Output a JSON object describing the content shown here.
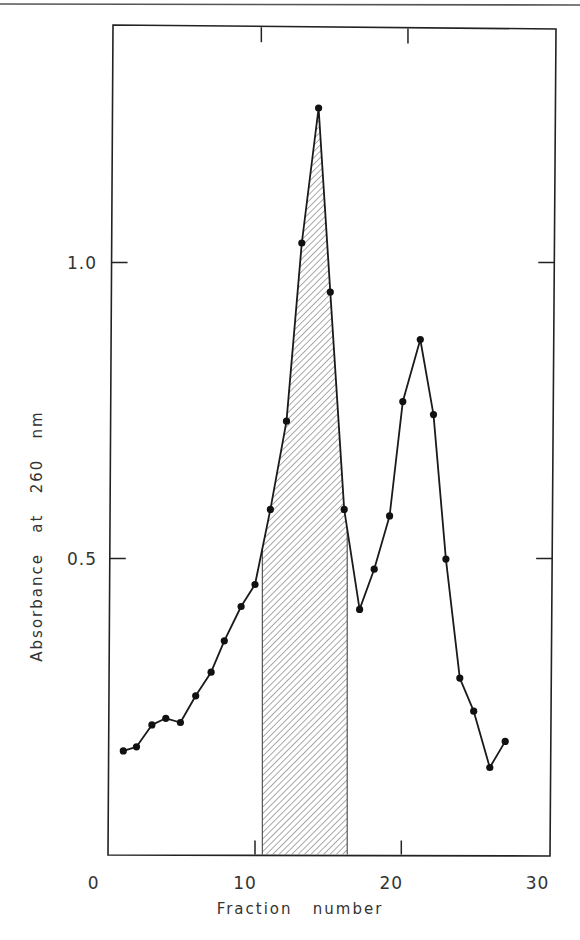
{
  "chart_data": {
    "type": "line",
    "title": "",
    "xlabel": "Fraction   number",
    "ylabel": "Absorbance   at   260   nm",
    "xlim": [
      0,
      30
    ],
    "ylim": [
      0,
      1.4
    ],
    "x_ticks": [
      0,
      10,
      20,
      30
    ],
    "x_tick_labels": [
      "0",
      "10",
      "20",
      "30"
    ],
    "y_ticks": [
      0.5,
      1.0
    ],
    "y_tick_labels": [
      "0.5",
      "1.0"
    ],
    "grid": false,
    "legend": null,
    "series": [
      {
        "name": "A260",
        "marker": "filled-circle",
        "color": "#1a1a1a",
        "x": [
          1,
          2,
          3,
          4,
          5,
          6,
          7,
          8,
          9,
          10,
          11,
          12,
          13,
          14,
          15,
          16,
          17,
          18,
          19,
          20,
          21,
          22,
          23,
          24,
          25,
          26,
          27
        ],
        "x_drawn": [
          1.0,
          1.9,
          2.95,
          3.9,
          4.9,
          5.95,
          7.0,
          7.9,
          9.05,
          10.0,
          11.05,
          12.15,
          13.2,
          14.35,
          15.15,
          16.1,
          17.15,
          18.15,
          19.2,
          20.1,
          21.3,
          22.2,
          23.05,
          24.0,
          24.95,
          26.05,
          27.1
        ],
        "values": [
          0.175,
          0.182,
          0.219,
          0.23,
          0.223,
          0.268,
          0.308,
          0.361,
          0.419,
          0.456,
          0.583,
          0.732,
          1.033,
          1.261,
          0.95,
          0.583,
          0.414,
          0.482,
          0.572,
          0.765,
          0.87,
          0.743,
          0.499,
          0.298,
          0.242,
          0.147,
          0.191
        ]
      }
    ],
    "annotations": [
      {
        "type": "shaded-region",
        "pattern": "diagonal-hatch",
        "x_start": 10.5,
        "x_end": 16.3,
        "description": "hatched area under first peak"
      }
    ]
  }
}
